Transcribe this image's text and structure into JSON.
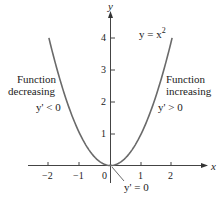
{
  "chart_data": {
    "type": "line",
    "title": "",
    "xlabel": "x",
    "ylabel": "y",
    "xlim": [
      -2.8,
      3
    ],
    "ylim": [
      -0.6,
      4.9
    ],
    "x_ticks": [
      -2,
      -1,
      0,
      1,
      2
    ],
    "y_ticks": [
      1,
      2,
      3,
      4
    ],
    "series": [
      {
        "name": "y = x^2",
        "function": "x^2",
        "x": [
          -2,
          -1.5,
          -1,
          -0.5,
          0,
          0.5,
          1,
          1.5,
          2
        ],
        "values": [
          4,
          2.25,
          1,
          0.25,
          0,
          0.25,
          1,
          2.25,
          4
        ]
      }
    ],
    "annotations": [
      {
        "text": "y = x²",
        "position": "upper right"
      },
      {
        "text": "Function decreasing",
        "position": "left"
      },
      {
        "text": "y' < 0",
        "position": "left"
      },
      {
        "text": "Function increasing",
        "position": "right"
      },
      {
        "text": "y' > 0",
        "position": "right"
      },
      {
        "text": "y' = 0",
        "position": "origin, bottom"
      }
    ],
    "grid": false,
    "legend": "none"
  },
  "labels": {
    "x_axis": "x",
    "y_axis": "y",
    "curve": "y = x",
    "curve_exp": "2",
    "left_1": "Function",
    "left_2": "decreasing",
    "left_3": "y' < 0",
    "right_1": "Function",
    "right_2": "increasing",
    "right_3": "y' > 0",
    "bottom": "y' = 0",
    "ticks_x": [
      "−2",
      "−1",
      "0",
      "1",
      "2"
    ],
    "ticks_y": [
      "1",
      "2",
      "3",
      "4"
    ]
  }
}
